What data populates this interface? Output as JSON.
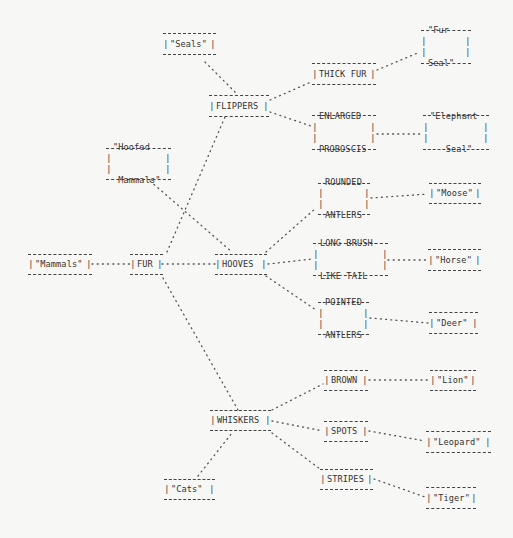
{
  "diagram": {
    "type": "classification-tree",
    "nodes": {
      "seals": {
        "lines": [
          "\"Seals\""
        ]
      },
      "flippers": {
        "lines": [
          "FLIPPERS"
        ]
      },
      "thick_fur": {
        "lines": [
          "THICK FUR"
        ]
      },
      "fur_seal": {
        "lines": [
          "\"Fur",
          "Seal\""
        ]
      },
      "enlarged_proboscis": {
        "lines": [
          "ENLARGED",
          "PROBOSCIS"
        ]
      },
      "elephant_seal": {
        "lines": [
          "\"Elephant",
          "   Seal\""
        ]
      },
      "hoofed_mammals": {
        "lines": [
          "\"Hoofed",
          " Mammals\""
        ]
      },
      "mammals": {
        "lines": [
          "\"Mammals\""
        ]
      },
      "fur": {
        "lines": [
          "FUR"
        ]
      },
      "hooves": {
        "lines": [
          "HOOVES"
        ]
      },
      "rounded_antlers": {
        "lines": [
          "ROUNDED",
          "ANTLERS"
        ]
      },
      "moose": {
        "lines": [
          "\"Moose\""
        ]
      },
      "long_brush_like_tail": {
        "lines": [
          "LONG BRUSH-",
          "LIKE TAIL"
        ]
      },
      "horse": {
        "lines": [
          "\"Horse\""
        ]
      },
      "pointed_antlers": {
        "lines": [
          "POINTED",
          "ANTLERS"
        ]
      },
      "deer": {
        "lines": [
          "\"Deer\""
        ]
      },
      "brown": {
        "lines": [
          "BROWN"
        ]
      },
      "lion": {
        "lines": [
          "\"Lion\""
        ]
      },
      "whiskers": {
        "lines": [
          "WHISKERS"
        ]
      },
      "spots": {
        "lines": [
          "SPOTS"
        ]
      },
      "leopard": {
        "lines": [
          "\"Leopard\""
        ]
      },
      "stripes": {
        "lines": [
          "STRIPES"
        ]
      },
      "cats": {
        "lines": [
          "\"Cats\""
        ]
      },
      "tiger": {
        "lines": [
          "\"Tiger\""
        ]
      }
    },
    "edges": [
      [
        "mammals",
        "fur"
      ],
      [
        "fur",
        "hooves"
      ],
      [
        "fur",
        "flippers"
      ],
      [
        "fur",
        "whiskers"
      ],
      [
        "seals",
        "flippers"
      ],
      [
        "flippers",
        "thick_fur"
      ],
      [
        "flippers",
        "enlarged_proboscis"
      ],
      [
        "thick_fur",
        "fur_seal"
      ],
      [
        "enlarged_proboscis",
        "elephant_seal"
      ],
      [
        "hoofed_mammals",
        "hooves"
      ],
      [
        "hooves",
        "rounded_antlers"
      ],
      [
        "hooves",
        "long_brush_like_tail"
      ],
      [
        "hooves",
        "pointed_antlers"
      ],
      [
        "rounded_antlers",
        "moose"
      ],
      [
        "long_brush_like_tail",
        "horse"
      ],
      [
        "pointed_antlers",
        "deer"
      ],
      [
        "whiskers",
        "brown"
      ],
      [
        "whiskers",
        "spots"
      ],
      [
        "whiskers",
        "stripes"
      ],
      [
        "cats",
        "whiskers"
      ],
      [
        "brown",
        "lion"
      ],
      [
        "spots",
        "leopard"
      ],
      [
        "stripes",
        "tiger"
      ]
    ]
  }
}
